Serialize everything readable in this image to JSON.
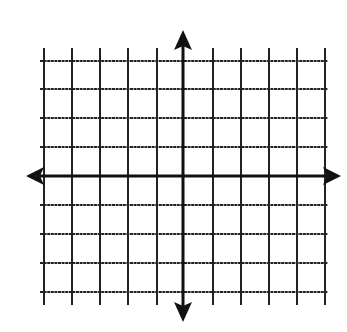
{
  "diagram": {
    "type": "coordinate-plane",
    "colors": {
      "background": "#ffffff",
      "grid": "#222222",
      "axis": "#111111"
    },
    "grid": {
      "vertical_lines_x": [
        44,
        72,
        100,
        128,
        157,
        213,
        241,
        269,
        297,
        325
      ],
      "horizontal_lines_y": [
        61,
        89,
        118,
        147,
        205,
        234,
        263,
        292
      ],
      "vertical_extent": [
        48,
        305
      ],
      "horizontal_extent": [
        40,
        328
      ]
    },
    "x_axis": {
      "y": 176,
      "from": 26,
      "to": 341,
      "arrows": [
        "left-arrow-icon",
        "right-arrow-icon"
      ]
    },
    "y_axis": {
      "x": 183,
      "from": 30,
      "to": 322,
      "arrows": [
        "up-arrow-icon",
        "down-arrow-icon"
      ]
    },
    "origin": {
      "x": 183,
      "y": 176
    }
  }
}
